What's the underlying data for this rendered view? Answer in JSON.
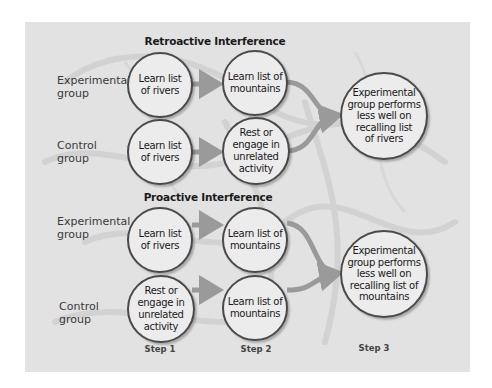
{
  "retroactive": {
    "title": "Retroactive Interference",
    "experimental_label": "Experimental\ngroup",
    "control_label": "Control\ngroup",
    "experimental_step1": "Learn list\nof rivers",
    "experimental_step2": "Learn list of\nmountains",
    "control_step1": "Learn list\nof rivers",
    "control_step2": "Rest or\nengage in\nunrelated\nactivity",
    "result": "Experimental\ngroup performs\nless well on\nrecalling list\nof rivers"
  },
  "proactive": {
    "title": "Proactive Interference",
    "experimental_label": "Experimental\ngroup",
    "control_label": "Control\ngroup",
    "experimental_step1": "Learn list\nof rivers",
    "experimental_step2": "Learn list of\nmountains",
    "control_step1": "Rest or\nengage in\nunrelated\nactivity",
    "control_step2": "Learn list of\nmountains",
    "result": "Experimental\ngroup performs\nless well on\nrecalling list of\nmountains"
  },
  "steps": [
    "Step 1",
    "Step 2",
    "Step 3"
  ],
  "colors": {
    "panel_bg": "#e2e2e2",
    "circle_fill": "#ececec",
    "circle_border": "#4a4a4a",
    "arrow": "#9a9a9a"
  }
}
